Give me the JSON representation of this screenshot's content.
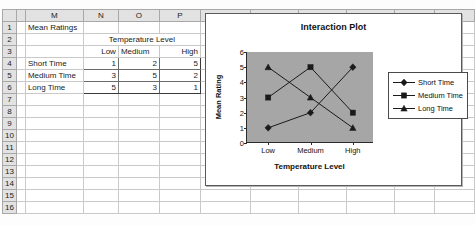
{
  "spreadsheet": {
    "column_headers": [
      "M",
      "N",
      "O",
      "P",
      "Q",
      "R",
      "S",
      "T",
      "U",
      "V"
    ],
    "row_headers": [
      "1",
      "2",
      "3",
      "4",
      "5",
      "6",
      "7",
      "8",
      "9",
      "10",
      "11",
      "12",
      "13",
      "14",
      "15",
      "16"
    ],
    "title_cell": "Mean Ratings",
    "group_header": "Temperature Level",
    "column_labels": [
      "Low",
      "Medium",
      "High"
    ],
    "row_labels": [
      "Short Time",
      "Medium Time",
      "Long Time"
    ],
    "values": [
      [
        "1",
        "2",
        "5"
      ],
      [
        "3",
        "5",
        "2"
      ],
      [
        "5",
        "3",
        "1"
      ]
    ]
  },
  "chart_data": {
    "type": "line",
    "title": "Interaction Plot",
    "xlabel": "Temperature Level",
    "ylabel": "Mean Rating",
    "categories": [
      "Low",
      "Medium",
      "High"
    ],
    "series": [
      {
        "name": "Short Time",
        "values": [
          1,
          2,
          5
        ],
        "marker": "diamond"
      },
      {
        "name": "Medium Time",
        "values": [
          3,
          5,
          2
        ],
        "marker": "square"
      },
      {
        "name": "Long Time",
        "values": [
          5,
          3,
          1
        ],
        "marker": "triangle"
      }
    ],
    "ylim": [
      0,
      6
    ],
    "yticks": [
      0,
      1,
      2,
      3,
      4,
      5,
      6
    ],
    "grid": false,
    "legend_position": "right",
    "plot_background": "#a6a6a6",
    "line_color": "#1a1a1a"
  }
}
